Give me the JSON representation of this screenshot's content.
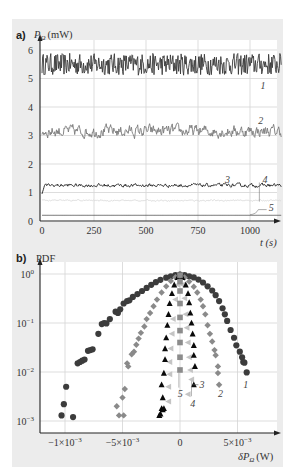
{
  "figure": {
    "background_color": "#ececec"
  },
  "chart_data": [
    {
      "panel": "a",
      "type": "line",
      "panel_label": "a)",
      "ylabel_symbol": "P",
      "ylabel_sub": "Ω",
      "ylabel_unit": "(mW)",
      "xlabel": "t (s)",
      "xlim": [
        0,
        1150
      ],
      "ylim": [
        0,
        6
      ],
      "x_ticks": [
        0,
        250,
        500,
        750,
        1000
      ],
      "x_tick_labels": [
        "0",
        "250",
        "500",
        "750",
        "1000"
      ],
      "y_ticks": [
        0,
        1,
        2,
        3,
        4,
        5,
        6
      ],
      "y_tick_labels": [
        "0",
        "1",
        "2",
        "3",
        "4",
        "5",
        "6"
      ],
      "grid": true,
      "series": [
        {
          "name": "1",
          "mean": 5.5,
          "noise_amplitude": 0.35,
          "color": "#3a3a3a",
          "label_at": [
            1050,
            4.75
          ]
        },
        {
          "name": "2",
          "mean": 3.15,
          "noise_amplitude": 0.17,
          "color": "#7a7a7a",
          "label_at": [
            1040,
            3.5
          ]
        },
        {
          "name": "3",
          "mean": 1.25,
          "noise_amplitude": 0.05,
          "start_value": 0.95,
          "color": "#1e1e1e",
          "label_at": [
            880,
            1.45
          ]
        },
        {
          "name": "4",
          "mean": 0.72,
          "noise_amplitude": 0.02,
          "color": "#d8d8d8",
          "label_at": [
            1060,
            1.45
          ]
        },
        {
          "name": "5",
          "mean": 0.2,
          "noise_amplitude": 0.0,
          "color": "#555555",
          "label_at": [
            1090,
            0.45
          ]
        }
      ],
      "duration_s": 1150
    },
    {
      "panel": "b",
      "type": "scatter",
      "panel_label": "b)",
      "ylabel": "PDF",
      "xlabel_symbol": "δP",
      "xlabel_sub": "Ω",
      "xlabel_unit": "(W)",
      "yscale": "log",
      "xlim": [
        -0.00125,
        0.00075
      ],
      "ylim": [
        0.0005,
        1.3
      ],
      "x_ticks": [
        -0.001,
        -0.0005,
        0,
        0.0005
      ],
      "x_tick_labels": [
        "−1×10",
        "−5×10",
        "0",
        "5×10"
      ],
      "x_tick_exponents": [
        "−3",
        "−3",
        "",
        "−3"
      ],
      "y_ticks": [
        1,
        0.1,
        0.01,
        0.001
      ],
      "y_tick_labels": [
        "10",
        "10",
        "10",
        "10"
      ],
      "y_tick_exponents": [
        "0",
        "−1",
        "−2",
        "−3"
      ],
      "grid": true,
      "series": [
        {
          "name": "1",
          "marker": "circle",
          "color": "#3c3c3c",
          "points": [
            [
              -0.00103,
              0.0013
            ],
            [
              -0.00101,
              0.0022
            ],
            [
              -0.00099,
              0.005
            ],
            [
              -0.00093,
              0.0012
            ],
            [
              -0.00089,
              0.015
            ],
            [
              -0.00087,
              0.016
            ],
            [
              -0.00085,
              0.017
            ],
            [
              -0.00083,
              0.018
            ],
            [
              -0.0008,
              0.027
            ],
            [
              -0.00078,
              0.028
            ],
            [
              -0.00076,
              0.029
            ],
            [
              -0.00071,
              0.06
            ],
            [
              -0.00068,
              0.095
            ],
            [
              -0.00066,
              0.1
            ],
            [
              -0.00064,
              0.098
            ],
            [
              -0.00061,
              0.12
            ],
            [
              -0.00056,
              0.17
            ],
            [
              -0.00054,
              0.16
            ],
            [
              -0.00052,
              0.19
            ],
            [
              -0.00049,
              0.25
            ],
            [
              -0.00046,
              0.28
            ],
            [
              -0.00044,
              0.29
            ],
            [
              -0.00041,
              0.34
            ],
            [
              -0.00037,
              0.39
            ],
            [
              -0.00033,
              0.45
            ],
            [
              -0.00029,
              0.52
            ],
            [
              -0.00025,
              0.6
            ],
            [
              -0.00021,
              0.68
            ],
            [
              -0.00017,
              0.76
            ],
            [
              -0.00012,
              0.84
            ],
            [
              -8e-05,
              0.9
            ],
            [
              -4e-05,
              0.95
            ],
            [
              0.0,
              0.97
            ],
            [
              4e-05,
              0.95
            ],
            [
              8e-05,
              0.9
            ],
            [
              0.00012,
              0.85
            ],
            [
              0.00016,
              0.77
            ],
            [
              0.0002,
              0.67
            ],
            [
              0.00024,
              0.56
            ],
            [
              0.00028,
              0.46
            ],
            [
              0.00031,
              0.37
            ],
            [
              0.00034,
              0.28
            ],
            [
              0.00037,
              0.2
            ],
            [
              0.00039,
              0.15
            ],
            [
              0.00041,
              0.11
            ],
            [
              0.00044,
              0.072
            ],
            [
              0.00047,
              0.05
            ],
            [
              0.00049,
              0.035
            ],
            [
              0.00052,
              0.026
            ],
            [
              0.00054,
              0.02
            ],
            [
              0.00055,
              0.016
            ],
            [
              0.00056,
              0.0155
            ],
            [
              0.00058,
              0.0098
            ]
          ]
        },
        {
          "name": "2",
          "marker": "diamond",
          "color": "#8a8a8a",
          "points": [
            [
              -0.00055,
              0.002
            ],
            [
              -0.00053,
              0.0013
            ],
            [
              -0.00049,
              0.0013
            ],
            [
              -0.0005,
              0.003
            ],
            [
              -0.00048,
              0.0045
            ],
            [
              -0.00046,
              0.015
            ],
            [
              -0.00045,
              0.013
            ],
            [
              -0.00042,
              0.023
            ],
            [
              -0.0004,
              0.026
            ],
            [
              -0.00038,
              0.036
            ],
            [
              -0.00036,
              0.048
            ],
            [
              -0.00034,
              0.063
            ],
            [
              -0.00031,
              0.085
            ],
            [
              -0.00029,
              0.12
            ],
            [
              -0.00026,
              0.16
            ],
            [
              -0.00023,
              0.22
            ],
            [
              -0.0002,
              0.3
            ],
            [
              -0.00016,
              0.42
            ],
            [
              -0.00012,
              0.56
            ],
            [
              -8e-05,
              0.72
            ],
            [
              -4e-05,
              0.86
            ],
            [
              0.0,
              0.95
            ],
            [
              4e-05,
              0.85
            ],
            [
              8e-05,
              0.7
            ],
            [
              0.00012,
              0.55
            ],
            [
              0.00015,
              0.42
            ],
            [
              0.00018,
              0.3
            ],
            [
              0.0002,
              0.22
            ],
            [
              0.00022,
              0.15
            ],
            [
              0.00024,
              0.09
            ],
            [
              0.00026,
              0.06
            ],
            [
              0.00028,
              0.042
            ],
            [
              0.0003,
              0.028
            ],
            [
              0.00031,
              0.022
            ],
            [
              0.00033,
              0.013
            ],
            [
              0.00033,
              0.0095
            ],
            [
              0.00034,
              0.0055
            ]
          ]
        },
        {
          "name": "3",
          "marker": "triangle",
          "color": "#0a0a0a",
          "points": [
            [
              -0.00018,
              0.0013
            ],
            [
              -0.00017,
              0.0014
            ],
            [
              -0.00016,
              0.0018
            ],
            [
              -0.00015,
              0.0017
            ],
            [
              -0.00014,
              0.0018
            ],
            [
              -0.00015,
              0.003
            ],
            [
              -0.00016,
              0.0055
            ],
            [
              -0.00014,
              0.0095
            ],
            [
              -0.00013,
              0.018
            ],
            [
              -0.00013,
              0.03
            ],
            [
              -0.00012,
              0.05
            ],
            [
              -0.00011,
              0.09
            ],
            [
              -0.0001,
              0.15
            ],
            [
              -9e-05,
              0.25
            ],
            [
              -7e-05,
              0.4
            ],
            [
              -5e-05,
              0.6
            ],
            [
              -2e-05,
              0.85
            ],
            [
              0.0,
              0.97
            ],
            [
              2e-05,
              0.85
            ],
            [
              5e-05,
              0.6
            ],
            [
              7e-05,
              0.4
            ],
            [
              8e-05,
              0.26
            ],
            [
              9e-05,
              0.16
            ],
            [
              0.0001,
              0.1
            ],
            [
              0.00011,
              0.06
            ],
            [
              0.00012,
              0.035
            ],
            [
              0.00012,
              0.022
            ],
            [
              0.00013,
              0.013
            ],
            [
              0.00012,
              0.0055
            ]
          ]
        },
        {
          "name": "4",
          "marker": "triangle-left",
          "color": "#c4c4c4",
          "points": [
            [
              -0.0001,
              0.0025
            ],
            [
              -0.0001,
              0.005
            ],
            [
              -9e-05,
              0.009
            ],
            [
              -9e-05,
              0.016
            ],
            [
              -8e-05,
              0.03
            ],
            [
              -7e-05,
              0.06
            ],
            [
              -6e-05,
              0.12
            ],
            [
              -4e-05,
              0.3
            ],
            [
              -2e-05,
              0.6
            ],
            [
              0.0,
              0.9
            ],
            [
              2e-05,
              0.6
            ],
            [
              4e-05,
              0.32
            ],
            [
              5e-05,
              0.15
            ],
            [
              6e-05,
              0.08
            ],
            [
              7e-05,
              0.04
            ],
            [
              8e-05,
              0.02
            ],
            [
              9e-05,
              0.011
            ],
            [
              0.0001,
              0.007
            ],
            [
              7e-05,
              0.0035
            ]
          ]
        },
        {
          "name": "5",
          "marker": "square",
          "color": "#8c8c8c",
          "points": [
            [
              0.0,
              0.011
            ],
            [
              0.0,
              0.02
            ],
            [
              0.0,
              0.04
            ],
            [
              0.0,
              0.07
            ],
            [
              0.0,
              0.13
            ],
            [
              0.0,
              0.25
            ],
            [
              0.0,
              0.45
            ],
            [
              0.0,
              0.7
            ],
            [
              0.0,
              0.95
            ]
          ]
        }
      ],
      "annotations": [
        {
          "text": "1",
          "at": [
            0.00055,
            0.0055
          ]
        },
        {
          "text": "2",
          "at": [
            0.00033,
            0.0035
          ]
        },
        {
          "text": "3",
          "at": [
            0.00017,
            0.0055
          ]
        },
        {
          "text": "4",
          "at": [
            9e-05,
            0.0022
          ]
        },
        {
          "text": "5",
          "at": [
            -2e-05,
            0.0035
          ]
        }
      ]
    }
  ]
}
